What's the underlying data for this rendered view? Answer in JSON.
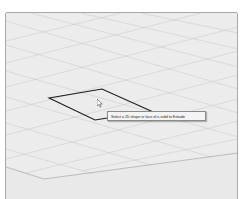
{
  "viewport": {
    "background": "#e9e9e9",
    "grid_color": "#c4c4c4",
    "ground_edge_color": "#9a9a9a"
  },
  "sketch_shape": {
    "type": "parallelogram",
    "stroke": "#1a1a1a"
  },
  "tooltip": {
    "text": "Select a 2D shape or face of a solid to Extrude"
  },
  "cursor": {
    "icon": "arrow-pointer-icon"
  }
}
